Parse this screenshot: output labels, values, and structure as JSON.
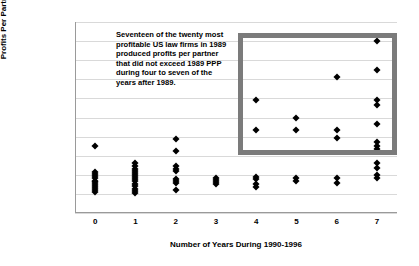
{
  "chart_data": {
    "type": "scatter",
    "title": "",
    "xlabel": "Number of Years During 1990-1996",
    "ylabel": "Profits Per Partner, 1989",
    "xlim": [
      -0.5,
      7.5
    ],
    "ylim": [
      0,
      2000000
    ],
    "grid": true,
    "legend": "none",
    "xticks": [
      "0",
      "1",
      "2",
      "3",
      "4",
      "5",
      "6",
      "7"
    ],
    "yticks": [
      "$0",
      "$200,000",
      "$400,000",
      "$600,000",
      "$800,000",
      "$1,000,000",
      "$1,200,000",
      "$1,400,000",
      "$1,600,000",
      "$1,800,000",
      "$2,000,000"
    ],
    "ytick_values": [
      0,
      200000,
      400000,
      600000,
      800000,
      1000000,
      1200000,
      1400000,
      1600000,
      1800000,
      2000000
    ],
    "annotation": "Seventeen of the twenty most profitable US law firms in 1989 produced profits per partner that did not exceed 1989 PPP during  four to seven of the years after 1989.",
    "highlight_box": {
      "x_range": [
        3.5,
        7.3
      ],
      "y_range": [
        620000,
        1900000
      ],
      "color": "#7b7b7b"
    },
    "point_color": "#000000",
    "marker": "diamond",
    "points": [
      {
        "x": 0,
        "y": 700000
      },
      {
        "x": 0,
        "y": 430000
      },
      {
        "x": 0,
        "y": 410000
      },
      {
        "x": 0,
        "y": 390000
      },
      {
        "x": 0,
        "y": 370000
      },
      {
        "x": 0,
        "y": 340000
      },
      {
        "x": 0,
        "y": 320000
      },
      {
        "x": 0,
        "y": 300000
      },
      {
        "x": 0,
        "y": 280000
      },
      {
        "x": 0,
        "y": 260000
      },
      {
        "x": 0,
        "y": 240000
      },
      {
        "x": 0,
        "y": 220000
      },
      {
        "x": 1,
        "y": 520000
      },
      {
        "x": 1,
        "y": 490000
      },
      {
        "x": 1,
        "y": 460000
      },
      {
        "x": 1,
        "y": 440000
      },
      {
        "x": 1,
        "y": 420000
      },
      {
        "x": 1,
        "y": 400000
      },
      {
        "x": 1,
        "y": 380000
      },
      {
        "x": 1,
        "y": 355000
      },
      {
        "x": 1,
        "y": 330000
      },
      {
        "x": 1,
        "y": 305000
      },
      {
        "x": 1,
        "y": 280000
      },
      {
        "x": 1,
        "y": 255000
      },
      {
        "x": 1,
        "y": 230000
      },
      {
        "x": 1,
        "y": 210000
      },
      {
        "x": 2,
        "y": 775000
      },
      {
        "x": 2,
        "y": 650000
      },
      {
        "x": 2,
        "y": 490000
      },
      {
        "x": 2,
        "y": 460000
      },
      {
        "x": 2,
        "y": 440000
      },
      {
        "x": 2,
        "y": 360000
      },
      {
        "x": 2,
        "y": 330000
      },
      {
        "x": 2,
        "y": 310000
      },
      {
        "x": 2,
        "y": 240000
      },
      {
        "x": 3,
        "y": 370000
      },
      {
        "x": 3,
        "y": 345000
      },
      {
        "x": 3,
        "y": 320000
      },
      {
        "x": 3,
        "y": 300000
      },
      {
        "x": 4,
        "y": 1180000
      },
      {
        "x": 4,
        "y": 870000
      },
      {
        "x": 4,
        "y": 380000
      },
      {
        "x": 4,
        "y": 355000
      },
      {
        "x": 4,
        "y": 300000
      },
      {
        "x": 4,
        "y": 275000
      },
      {
        "x": 5,
        "y": 1000000
      },
      {
        "x": 5,
        "y": 870000
      },
      {
        "x": 5,
        "y": 370000
      },
      {
        "x": 5,
        "y": 340000
      },
      {
        "x": 6,
        "y": 1420000
      },
      {
        "x": 6,
        "y": 870000
      },
      {
        "x": 6,
        "y": 790000
      },
      {
        "x": 6,
        "y": 370000
      },
      {
        "x": 6,
        "y": 310000
      },
      {
        "x": 7,
        "y": 1800000
      },
      {
        "x": 7,
        "y": 1500000
      },
      {
        "x": 7,
        "y": 1180000
      },
      {
        "x": 7,
        "y": 1130000
      },
      {
        "x": 7,
        "y": 930000
      },
      {
        "x": 7,
        "y": 740000
      },
      {
        "x": 7,
        "y": 700000
      },
      {
        "x": 7,
        "y": 670000
      },
      {
        "x": 7,
        "y": 520000
      },
      {
        "x": 7,
        "y": 470000
      },
      {
        "x": 7,
        "y": 400000
      },
      {
        "x": 7,
        "y": 370000
      }
    ]
  }
}
